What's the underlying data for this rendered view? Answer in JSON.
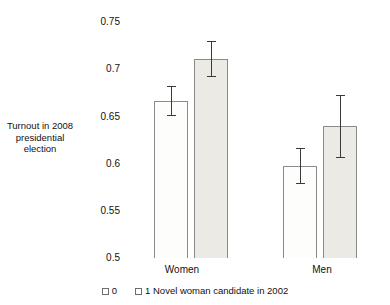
{
  "chart_data": {
    "type": "bar",
    "title": "",
    "xlabel": "",
    "ylabel": "Turnout in 2008 presidential election",
    "categories": [
      "Women",
      "Men"
    ],
    "ylim": [
      0.5,
      0.75
    ],
    "yticks": [
      0.75,
      0.7,
      0.65,
      0.6,
      0.55,
      0.5
    ],
    "ytick_labels": [
      "0.75",
      "0.7",
      "0.65",
      "0.6",
      "0.55",
      "0.5"
    ],
    "grid": false,
    "legend_position": "bottom",
    "error_bars": "vertical capped",
    "series": [
      {
        "name": "0",
        "legend_label": "0",
        "color": "#fdfdfb",
        "values": [
          0.666,
          0.597
        ],
        "err_low": [
          0.652,
          0.579
        ],
        "err_high": [
          0.682,
          0.617
        ]
      },
      {
        "name": "1 Novel woman candidate in 2002",
        "legend_label": "1 Novel woman candidate in 2002",
        "color": "#eceae4",
        "values": [
          0.711,
          0.64
        ],
        "err_low": [
          0.693,
          0.607
        ],
        "err_high": [
          0.73,
          0.673
        ]
      }
    ]
  },
  "axis": {
    "y_title_lines": [
      "Turnout in 2008",
      "presidential",
      "election"
    ],
    "tick_0": "0.75",
    "tick_1": "0.7",
    "tick_2": "0.65",
    "tick_3": "0.6",
    "tick_4": "0.55",
    "tick_5": "0.5"
  },
  "categories": {
    "women": "Women",
    "men": "Men"
  },
  "legend": {
    "item_0": "0",
    "item_1": "1 Novel woman candidate in 2002"
  }
}
